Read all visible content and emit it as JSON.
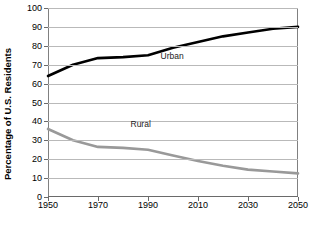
{
  "chart_data": {
    "type": "line",
    "title": "",
    "xlabel": "",
    "ylabel": "Percentage of U.S. Residents",
    "xlim": [
      1950,
      2050
    ],
    "ylim": [
      0,
      100
    ],
    "grid": true,
    "legend": "inline-labels",
    "xticks": [
      1950,
      1970,
      1990,
      2010,
      2030,
      2050
    ],
    "xtick_labels": [
      "1950",
      "1970",
      "1990",
      "2010",
      "2030",
      "2050"
    ],
    "yticks": [
      0,
      10,
      20,
      30,
      40,
      50,
      60,
      70,
      80,
      90,
      100
    ],
    "ytick_labels": [
      "0",
      "10",
      "20",
      "30",
      "40",
      "50",
      "60",
      "70",
      "80",
      "90",
      "100"
    ],
    "x": [
      1950,
      1960,
      1970,
      1980,
      1990,
      2000,
      2010,
      2020,
      2030,
      2040,
      2050
    ],
    "series": [
      {
        "name": "Urban",
        "color": "#000000",
        "label_x": 1995,
        "label_y": 74,
        "values": [
          64,
          70,
          73.5,
          74,
          75,
          79,
          82,
          85,
          87,
          89,
          90
        ]
      },
      {
        "name": "Rural",
        "color": "#999999",
        "label_x": 1983,
        "label_y": 38,
        "values": [
          36,
          30,
          26.5,
          26,
          25,
          22,
          19,
          16.5,
          14.5,
          13.5,
          12.5
        ]
      }
    ]
  }
}
